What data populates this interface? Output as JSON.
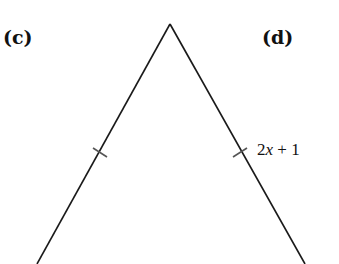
{
  "labels": {
    "c": "(c)",
    "d": "(d)"
  },
  "side_label": {
    "coef": "2",
    "var": "x",
    "rest": " + 1"
  },
  "triangle": {
    "apex": [
      170,
      24
    ],
    "left_base": [
      37,
      264
    ],
    "right_base": [
      305,
      264
    ],
    "tick_marks": [
      "left-side",
      "right-side"
    ],
    "stroke": "#1a1a1a"
  }
}
